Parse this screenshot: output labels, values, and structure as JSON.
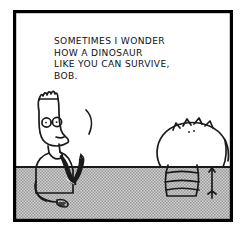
{
  "comic": {
    "title": "Dilbert comic panel",
    "panel_count": 1,
    "style": "black and white line art with gray halftone floor",
    "border_color": "#000000",
    "background_color": "#ffffff",
    "ink_color": "#1a1a1a",
    "floor_color": "#b9b9b9",
    "tie_color": "#1a1a1a"
  },
  "dialogue": {
    "speaker": "Dilbert",
    "full_text": "SOMETIMES I WONDER\nHOW A DINOSAUR\nLIKE YOU CAN SURVIVE,\nBOB.",
    "lines": [
      "SOMETIMES I WONDER",
      "HOW A DINOSAUR",
      "LIKE YOU CAN SURVIVE,",
      "BOB."
    ],
    "tail_shape": "curved-hook"
  },
  "characters": [
    {
      "name": "Dilbert",
      "position": "left",
      "facing": "right",
      "features": [
        "spiky-hair",
        "round-glasses",
        "pointed-nose",
        "upturned-necktie",
        "short-sleeve-shirt"
      ]
    },
    {
      "name": "Bob the Dinosaur",
      "position": "right",
      "facing": "away",
      "features": [
        "back-spikes",
        "striped-legs",
        "thin-tail",
        "rounded-body"
      ]
    }
  ],
  "scene": {
    "floor_label": "halftone floor strip",
    "horizon_y": 156
  }
}
